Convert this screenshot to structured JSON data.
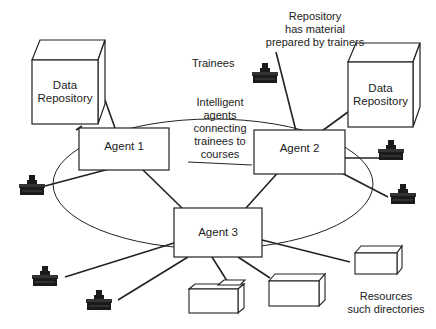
{
  "diagram": {
    "annotations": {
      "repository_note": [
        "Repository",
        "has material",
        "prepared by trainers"
      ],
      "trainees": "Trainees",
      "center_note": [
        "Intelligent",
        "agents",
        "connecting",
        "trainees to",
        "courses"
      ],
      "resources_note": [
        "Resources",
        "such directories"
      ]
    },
    "nodes": {
      "repo_left": [
        "Data",
        "Repository"
      ],
      "repo_right": [
        "Data",
        "Repository"
      ],
      "agent1": "Agent 1",
      "agent2": "Agent 2",
      "agent3": "Agent 3"
    },
    "icons": {
      "trainee": "trainee-workstation-icon",
      "resource": "resource-box-icon"
    },
    "colors": {
      "stroke": "#222222",
      "background": "#ffffff",
      "icon_fill": "#1a1a1a"
    }
  }
}
